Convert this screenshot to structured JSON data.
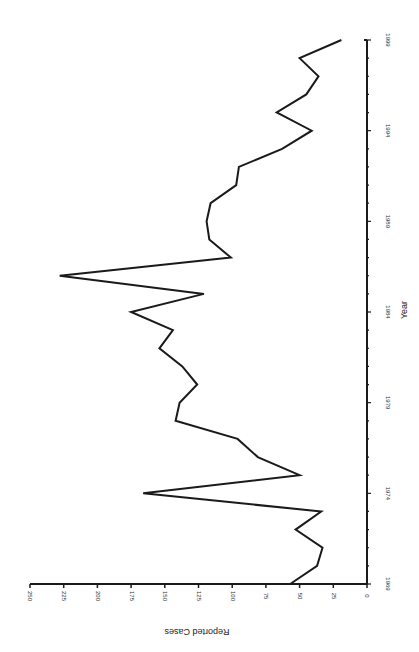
{
  "chart_data": {
    "type": "line",
    "title": "",
    "xlabel": "Year",
    "ylabel": "Reported Cases",
    "orientation_note": "figure rotated 90 degrees counter-clockwise",
    "xlim": [
      1969,
      1999
    ],
    "ylim": [
      0,
      250
    ],
    "x_ticks": [
      1969,
      1974,
      1979,
      1984,
      1989,
      1994,
      1999
    ],
    "y_ticks": [
      0,
      25,
      50,
      75,
      100,
      125,
      150,
      175,
      200,
      225,
      250
    ],
    "grid": false,
    "legend": null,
    "x": [
      1969,
      1970,
      1971,
      1972,
      1973,
      1974,
      1975,
      1976,
      1977,
      1978,
      1979,
      1980,
      1981,
      1982,
      1983,
      1984,
      1985,
      1986,
      1987,
      1988,
      1989,
      1990,
      1991,
      1992,
      1993,
      1994,
      1995,
      1996,
      1997,
      1998,
      1999
    ],
    "series": [
      {
        "name": "Reported Cases",
        "values": [
          57,
          37,
          33,
          53,
          34,
          166,
          50,
          81,
          96,
          142,
          139,
          126,
          137,
          154,
          144,
          175,
          121,
          228,
          101,
          117,
          119,
          116,
          97,
          95,
          63,
          41,
          67,
          45,
          36,
          50,
          19
        ]
      }
    ]
  }
}
